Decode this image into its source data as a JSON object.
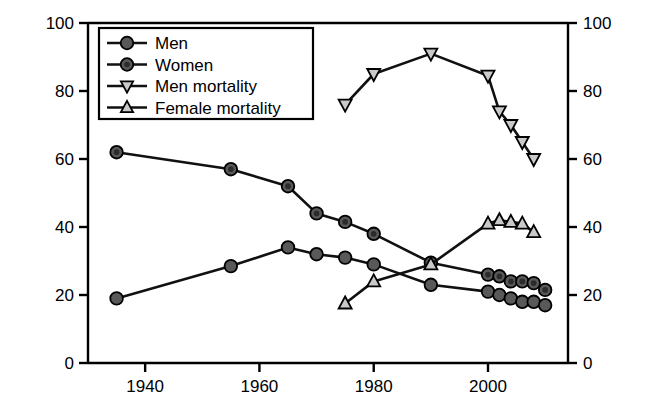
{
  "chart_data": {
    "type": "line",
    "title": "",
    "xlabel": "",
    "ylabel": "Smoking Prevalence (%)",
    "ylabel_right": "Mortality Rate Per 100,000",
    "xlim": [
      1930,
      2014
    ],
    "ylim": [
      0,
      100
    ],
    "ylim_right": [
      0,
      100
    ],
    "xticks": [
      1940,
      1960,
      1980,
      2000
    ],
    "xtick_labels": [
      "1940",
      "1960",
      "1980",
      "2000"
    ],
    "yticks": [
      0,
      20,
      40,
      60,
      80,
      100
    ],
    "ytick_labels": [
      "0",
      "20",
      "40",
      "60",
      "80",
      "100"
    ],
    "yticks_right": [
      0,
      20,
      40,
      60,
      80,
      100
    ],
    "ytick_labels_right": [
      "0",
      "20",
      "40",
      "60",
      "80",
      "100"
    ],
    "grid": false,
    "legend_position": "upper left",
    "series": [
      {
        "name": "Men",
        "axis": "left",
        "marker": "circle",
        "x": [
          1935,
          1955,
          1965,
          1970,
          1975,
          1980,
          1990,
          2000,
          2002,
          2004,
          2006,
          2008,
          2010
        ],
        "values": [
          19,
          28.5,
          34,
          32,
          31,
          29,
          23,
          21,
          20,
          19,
          18,
          18,
          17
        ]
      },
      {
        "name": "Women",
        "axis": "left",
        "marker": "circle-filled",
        "x": [
          1935,
          1955,
          1965,
          1970,
          1975,
          1980,
          1990,
          2000,
          2002,
          2004,
          2006,
          2008,
          2010
        ],
        "values": [
          62,
          57,
          52,
          44,
          41.5,
          38,
          29.5,
          26,
          25.5,
          24,
          24,
          23.5,
          21.5
        ]
      },
      {
        "name": "Men mortality",
        "axis": "right",
        "marker": "triangle-down",
        "x": [
          1975,
          1980,
          1990,
          2000,
          2002,
          2004,
          2006,
          2008
        ],
        "values": [
          76,
          85,
          91,
          84.5,
          74,
          70,
          65,
          60
        ]
      },
      {
        "name": "Female mortality",
        "axis": "right",
        "marker": "triangle-up",
        "x": [
          1975,
          1980,
          1990,
          2000,
          2002,
          2004,
          2006,
          2008
        ],
        "values": [
          17.5,
          24,
          29,
          41,
          42,
          41.5,
          41,
          38.5
        ]
      }
    ]
  },
  "legend": {
    "entries": [
      {
        "label": "Men",
        "marker": "circle"
      },
      {
        "label": "Women",
        "marker": "circle-filled"
      },
      {
        "label": "Men mortality",
        "marker": "triangle-down"
      },
      {
        "label": "Female mortality",
        "marker": "triangle-up"
      }
    ]
  },
  "axes": {
    "left_title": "Smoking Prevalence (%)",
    "right_title": "Mortality Rate Per 100,000"
  },
  "colors": {
    "line": "#111111",
    "marker_fill": "#595959",
    "marker_open": "#c9c9c9",
    "axis": "#000000",
    "background": "#ffffff"
  }
}
